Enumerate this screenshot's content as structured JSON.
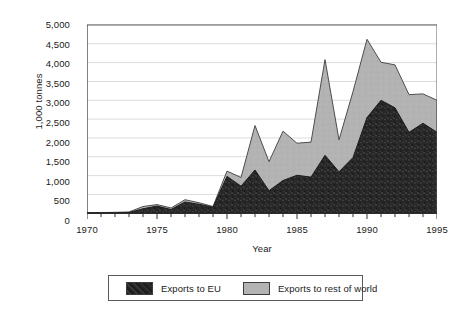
{
  "chart_data": {
    "type": "area",
    "stacked": true,
    "title": "",
    "subtitle": "",
    "xlabel": "Year",
    "ylabel": "1,000 tonnes",
    "xlim": [
      1970,
      1995
    ],
    "ylim": [
      0,
      5000
    ],
    "grid": "horizontal",
    "legend_position": "bottom",
    "x": [
      1970,
      1971,
      1972,
      1973,
      1974,
      1975,
      1976,
      1977,
      1978,
      1979,
      1980,
      1981,
      1982,
      1983,
      1984,
      1985,
      1986,
      1987,
      1988,
      1989,
      1990,
      1991,
      1992,
      1993,
      1994,
      1995
    ],
    "xtick_labels": [
      "1970",
      "1975",
      "1980",
      "1985",
      "1990",
      "1995"
    ],
    "xticks_major": [
      1970,
      1975,
      1980,
      1985,
      1990,
      1995
    ],
    "ytick_labels": [
      "0",
      "500",
      "1,000",
      "1,500",
      "2,000",
      "2,500",
      "3,000",
      "3,500",
      "4,000",
      "4,500",
      "5,000"
    ],
    "yticks": [
      0,
      500,
      1000,
      1500,
      2000,
      2500,
      3000,
      3500,
      4000,
      4500,
      5000
    ],
    "series": [
      {
        "name": "Exports to EU",
        "color": "#2b2b2b",
        "values": [
          10,
          10,
          15,
          20,
          120,
          190,
          100,
          300,
          240,
          160,
          980,
          720,
          1150,
          600,
          870,
          1010,
          960,
          1540,
          1100,
          1480,
          2540,
          3000,
          2800,
          2150,
          2390,
          2150
        ]
      },
      {
        "name": "Exports to rest of world",
        "color": "#b3b3b3",
        "values": [
          10,
          10,
          10,
          15,
          60,
          40,
          40,
          60,
          40,
          20,
          140,
          230,
          1180,
          770,
          1310,
          850,
          930,
          2540,
          850,
          1750,
          2080,
          1010,
          1140,
          1000,
          780,
          850
        ]
      }
    ],
    "totals": [
      20,
      20,
      25,
      35,
      180,
      230,
      140,
      360,
      280,
      180,
      1120,
      950,
      2330,
      1370,
      2180,
      1860,
      1890,
      4080,
      1950,
      3230,
      4620,
      4010,
      3940,
      3150,
      3170,
      3000
    ]
  },
  "axes": {
    "y_title": "1,000 tonnes",
    "x_title": "Year"
  },
  "legend": {
    "items": [
      {
        "label": "Exports to EU",
        "color": "#2b2b2b"
      },
      {
        "label": "Exports to rest of world",
        "color": "#b3b3b3"
      }
    ]
  }
}
